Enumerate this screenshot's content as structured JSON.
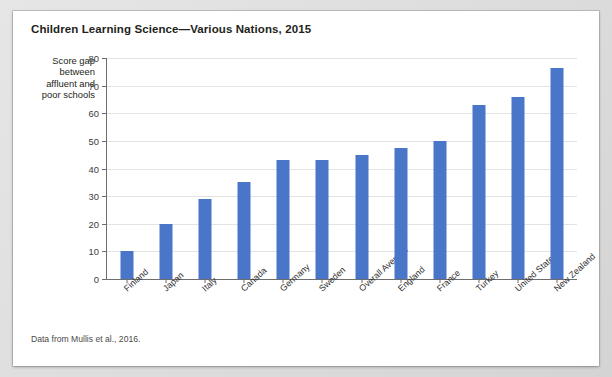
{
  "figure": {
    "title": "Children Learning Science—Various Nations, 2015",
    "source_note": "Data from Mullis et al., 2016."
  },
  "chart_data": {
    "type": "bar",
    "title": "Children Learning Science—Various Nations, 2015",
    "xlabel": "",
    "ylabel": "Score gap between affluent and poor schools",
    "ylabel_lines": [
      "Score gap",
      "between",
      "affluent and",
      "poor schools"
    ],
    "ylim": [
      0,
      80
    ],
    "ytick_labels": [
      "0",
      "10",
      "20",
      "30",
      "40",
      "50",
      "60",
      "70",
      "80"
    ],
    "yticks": [
      0,
      10,
      20,
      30,
      40,
      50,
      60,
      70,
      80
    ],
    "grid": true,
    "legend": false,
    "bar_color": "#4a76c9",
    "categories": [
      "Finland",
      "Japan",
      "Italy",
      "Canada",
      "Germany",
      "Sweden",
      "Overall Average",
      "England",
      "France",
      "Turkey",
      "United States",
      "New Zealand"
    ],
    "values": [
      10,
      20,
      29,
      35,
      43,
      43,
      45,
      47.5,
      50,
      63,
      66,
      76.5
    ]
  }
}
